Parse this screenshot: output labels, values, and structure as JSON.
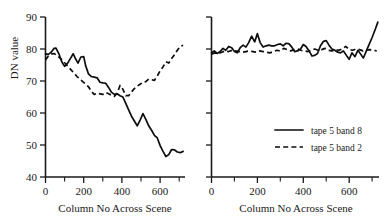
{
  "figure": {
    "panels": [
      {
        "id": "left-panel",
        "xlabel": "Column No Across Scene",
        "ylabel": "DN value",
        "y_ticklabels": [
          "90",
          "80",
          "70",
          "60",
          "50",
          "40"
        ],
        "x_ticklabels": [
          "0",
          "200",
          "400",
          "600"
        ]
      },
      {
        "id": "right-panel",
        "xlabel": "Column No Across Scene",
        "ylabel": "",
        "y_ticklabels": [],
        "x_ticklabels": [
          "0",
          "200",
          "400",
          "600"
        ]
      }
    ],
    "legend": {
      "position": "right-panel-lower-right",
      "entries": [
        {
          "label": "tape 5 band 8",
          "style": "solid"
        },
        {
          "label": "tape 5 band 2",
          "style": "dashed"
        }
      ]
    },
    "colors": {
      "line": "#0d0d0d",
      "axis": "#1a1a1a",
      "background": "#ffffff"
    }
  },
  "chart_data": [
    {
      "type": "line",
      "title": "",
      "xlabel": "Column No Across Scene",
      "ylabel": "DN value",
      "xlim": [
        0,
        730
      ],
      "ylim": [
        40,
        90
      ],
      "xticks": [
        0,
        200,
        400,
        600
      ],
      "xminorticks": [
        100,
        300,
        500,
        700
      ],
      "yticks": [
        40,
        50,
        60,
        70,
        80,
        90
      ],
      "grid": false,
      "legend": "none",
      "series": [
        {
          "name": "tape 5 band 8",
          "style": "solid",
          "x": [
            0,
            15,
            30,
            45,
            55,
            70,
            85,
            100,
            115,
            130,
            145,
            155,
            170,
            185,
            200,
            210,
            225,
            240,
            255,
            270,
            285,
            300,
            315,
            330,
            345,
            360,
            375,
            390,
            405,
            420,
            435,
            450,
            465,
            480,
            495,
            510,
            525,
            540,
            555,
            570,
            585,
            600,
            615,
            630,
            645,
            660,
            675,
            690,
            705,
            720
          ],
          "y": [
            78.5,
            78.3,
            79.0,
            80.2,
            80.3,
            78.5,
            76.0,
            74.6,
            75.5,
            77.0,
            78.5,
            77.2,
            75.6,
            77.5,
            77.6,
            74.8,
            72.2,
            71.4,
            71.2,
            71.0,
            69.6,
            69.4,
            69.3,
            68.0,
            66.5,
            65.8,
            66.0,
            65.4,
            65.0,
            63.0,
            61.0,
            59.0,
            57.5,
            56.0,
            57.8,
            59.8,
            58.0,
            56.0,
            54.6,
            53.0,
            52.2,
            49.8,
            48.0,
            46.4,
            47.0,
            48.6,
            48.5,
            47.8,
            47.6,
            48.0
          ]
        },
        {
          "name": "tape 5 band 2",
          "style": "dashed",
          "x": [
            0,
            15,
            30,
            45,
            60,
            75,
            90,
            105,
            120,
            135,
            150,
            165,
            180,
            195,
            210,
            225,
            240,
            255,
            270,
            285,
            300,
            315,
            330,
            345,
            360,
            375,
            390,
            405,
            420,
            435,
            450,
            465,
            480,
            495,
            510,
            525,
            540,
            555,
            570,
            585,
            600,
            615,
            630,
            645,
            660,
            675,
            690,
            705,
            720
          ],
          "y": [
            76.6,
            77.8,
            78.4,
            78.6,
            78.0,
            77.2,
            76.4,
            75.4,
            74.4,
            73.4,
            72.4,
            71.4,
            70.6,
            69.8,
            69.0,
            68.2,
            66.8,
            65.8,
            66.2,
            66.0,
            65.8,
            66.4,
            66.0,
            65.6,
            65.2,
            66.2,
            68.6,
            67.4,
            65.4,
            65.4,
            66.6,
            67.6,
            68.4,
            69.0,
            69.6,
            69.8,
            70.6,
            70.4,
            70.2,
            71.6,
            73.2,
            74.4,
            76.0,
            75.6,
            77.0,
            78.2,
            79.6,
            80.8,
            81.2
          ]
        }
      ]
    },
    {
      "type": "line",
      "title": "",
      "xlabel": "Column No Across Scene",
      "ylabel": "",
      "xlim": [
        0,
        730
      ],
      "ylim": [
        40,
        90
      ],
      "xticks": [
        0,
        200,
        400,
        600
      ],
      "xminorticks": [
        100,
        300,
        500,
        700
      ],
      "yticks": [
        40,
        50,
        60,
        70,
        80,
        90
      ],
      "grid": false,
      "legend": "lower right",
      "series": [
        {
          "name": "tape 5 band 8",
          "style": "solid",
          "x": [
            0,
            12,
            25,
            38,
            50,
            62,
            75,
            88,
            100,
            112,
            125,
            138,
            150,
            162,
            175,
            188,
            200,
            212,
            225,
            238,
            250,
            262,
            275,
            288,
            300,
            312,
            325,
            338,
            350,
            362,
            375,
            388,
            400,
            412,
            425,
            438,
            450,
            462,
            475,
            488,
            500,
            512,
            525,
            538,
            550,
            562,
            575,
            588,
            600,
            612,
            625,
            638,
            650,
            662,
            675,
            688,
            700,
            715,
            725
          ],
          "y": [
            78.8,
            79.4,
            78.6,
            79.2,
            80.2,
            79.6,
            80.8,
            80.4,
            79.2,
            78.8,
            80.4,
            81.2,
            80.6,
            82.0,
            84.0,
            82.2,
            84.8,
            82.0,
            80.6,
            81.0,
            81.2,
            81.0,
            81.0,
            81.4,
            81.6,
            81.0,
            81.8,
            81.6,
            80.6,
            79.2,
            79.4,
            80.0,
            81.4,
            80.8,
            79.4,
            77.8,
            78.0,
            78.6,
            81.0,
            82.4,
            82.6,
            81.2,
            80.0,
            79.6,
            79.0,
            78.8,
            79.4,
            78.0,
            76.8,
            78.8,
            77.6,
            79.6,
            78.4,
            77.2,
            79.4,
            81.6,
            83.6,
            86.4,
            88.4
          ]
        },
        {
          "name": "tape 5 band 2",
          "style": "dashed",
          "x": [
            0,
            15,
            30,
            45,
            60,
            75,
            90,
            105,
            120,
            135,
            150,
            165,
            180,
            195,
            210,
            225,
            240,
            255,
            270,
            285,
            300,
            315,
            330,
            345,
            360,
            375,
            390,
            405,
            420,
            435,
            450,
            465,
            480,
            495,
            510,
            525,
            540,
            555,
            570,
            585,
            600,
            615,
            630,
            645,
            660,
            675,
            690,
            705,
            720
          ],
          "y": [
            78.4,
            78.8,
            78.6,
            79.0,
            79.4,
            79.2,
            79.6,
            79.4,
            79.2,
            79.0,
            79.2,
            79.4,
            79.2,
            79.0,
            79.4,
            79.2,
            79.0,
            78.8,
            79.2,
            79.6,
            79.4,
            80.2,
            79.8,
            79.4,
            79.8,
            80.0,
            79.6,
            79.4,
            79.2,
            79.6,
            80.0,
            79.6,
            79.8,
            80.2,
            79.6,
            79.4,
            79.8,
            79.6,
            80.0,
            80.8,
            79.8,
            79.6,
            80.0,
            79.8,
            79.4,
            79.6,
            79.8,
            79.6,
            79.4
          ]
        }
      ]
    }
  ]
}
